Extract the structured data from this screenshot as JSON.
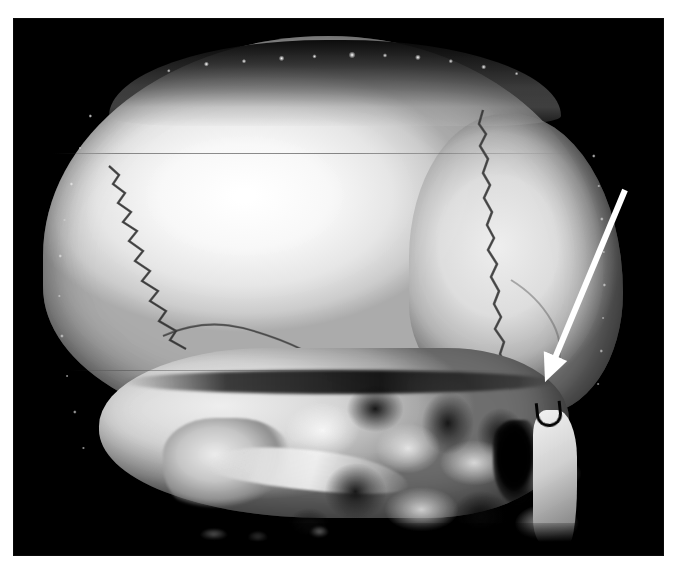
{
  "figure": {
    "modality": "CT",
    "render_type": "3D surface / volume rendering",
    "view": "left lateral oblique",
    "caption": "",
    "background_color": "#ffffff",
    "plate_color": "#000000"
  },
  "plate": {
    "x": 13,
    "y": 18,
    "width": 651,
    "height": 538,
    "border_label": "image-plate"
  },
  "annotation": {
    "marker_type": "arrow",
    "marker_label": "",
    "color": "#ffffff",
    "tail": {
      "x": 625,
      "y": 190
    },
    "tip": {
      "x": 545,
      "y": 382
    },
    "head_width": 26,
    "head_length": 28,
    "shaft_width": 6,
    "points_to": "frontozygomatic / lateral orbital region"
  },
  "anatomy": {
    "regions": [
      {
        "name": "cranial-vault",
        "label": "Cranial vault (parietal bone)"
      },
      {
        "name": "frontal-bone",
        "label": "Frontal bone"
      },
      {
        "name": "occipital-region",
        "label": "Occipital region"
      },
      {
        "name": "scalp-soft-tissue",
        "label": "Scalp / soft-tissue band"
      },
      {
        "name": "coronal-suture",
        "label": "Coronal suture"
      },
      {
        "name": "lambdoid-suture",
        "label": "Lambdoid suture"
      },
      {
        "name": "squamosal-suture",
        "label": "Squamosal suture"
      },
      {
        "name": "skull-base",
        "label": "Skull base / temporal bone"
      },
      {
        "name": "mastoid-process",
        "label": "Mastoid process"
      },
      {
        "name": "zygomatic-arch",
        "label": "Zygomatic arch"
      },
      {
        "name": "mandibular-ramus",
        "label": "Mandibular ramus"
      },
      {
        "name": "sinus-void",
        "label": "Paranasal sinus air space"
      },
      {
        "name": "foramen-marker",
        "label": "Foramen / vascular channel"
      }
    ]
  },
  "artifacts": {
    "scanlines": [
      {
        "name": "scanline-upper",
        "y": 153
      },
      {
        "name": "scanline-mid",
        "y": 370
      }
    ],
    "surface_speckles": "bright discrete skin-surface markers along the scalp contour"
  },
  "colors": {
    "bone_bright": "#f5f5f5",
    "bone_mid": "#c9c9c9",
    "bone_shadow": "#6f6f6f",
    "background": "#000000",
    "annotation": "#ffffff",
    "page": "#ffffff"
  }
}
